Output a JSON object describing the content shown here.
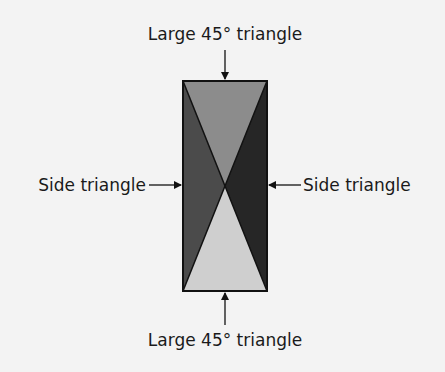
{
  "diagram": {
    "labels": {
      "top": "Large 45° triangle",
      "bottom": "Large 45° triangle",
      "left": "Side triangle",
      "right": "Side triangle"
    },
    "colors": {
      "background": "#f3f3f3",
      "top_triangle": "#8c8c8c",
      "bottom_triangle": "#cfcfcf",
      "left_triangle": "#4b4b4b",
      "right_triangle": "#262626",
      "outline": "#111111"
    }
  }
}
